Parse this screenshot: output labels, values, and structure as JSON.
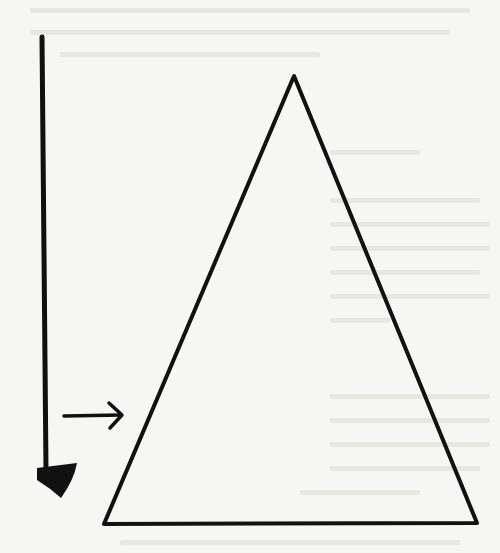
{
  "figure": {
    "description": "Hand-drawn diagram: vertical downward arrow beside a large triangle, with a small horizontal arrow pointing at the triangle's left side",
    "colors": {
      "paper": "#f6f6f4",
      "ink": "#111111",
      "bleed_through": "#e4e4e0"
    },
    "vertical_arrow": {
      "x": 42,
      "y_start": 36,
      "y_end": 470,
      "head_tip_y": 498
    },
    "horizontal_arrow": {
      "y": 416,
      "x_start": 64,
      "x_end": 122
    },
    "triangle": {
      "apex": [
        294,
        76
      ],
      "base_left": [
        103,
        524
      ],
      "base_right": [
        477,
        524
      ]
    }
  }
}
